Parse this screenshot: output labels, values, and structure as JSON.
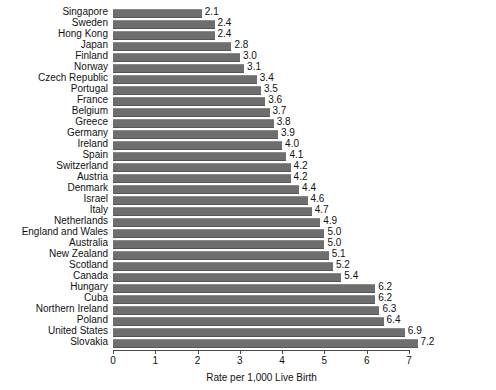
{
  "chart_data": {
    "type": "bar",
    "orientation": "horizontal",
    "title": "",
    "subtitle": "",
    "xlabel": "Rate per 1,000 Live Birth",
    "ylabel": "",
    "xlim": [
      0,
      7.4
    ],
    "xticks": [
      0,
      1,
      2,
      3,
      4,
      5,
      6,
      7
    ],
    "xtick_labels": [
      "0",
      "1",
      "2",
      "3",
      "4",
      "5",
      "6",
      "7"
    ],
    "grid": false,
    "legend": null,
    "bar_color": "#6e6e6e",
    "value_label_format": "one-decimal",
    "categories": [
      "Singapore",
      "Sweden",
      "Hong Kong",
      "Japan",
      "Finland",
      "Norway",
      "Czech Republic",
      "Portugal",
      "France",
      "Belgium",
      "Greece",
      "Germany",
      "Ireland",
      "Spain",
      "Switzerland",
      "Austria",
      "Denmark",
      "Israel",
      "Italy",
      "Netherlands",
      "England and Wales",
      "Australia",
      "New Zealand",
      "Scotland",
      "Canada",
      "Hungary",
      "Cuba",
      "Northern Ireland",
      "Poland",
      "United States",
      "Slovakia"
    ],
    "values": [
      2.1,
      2.4,
      2.4,
      2.8,
      3.0,
      3.1,
      3.4,
      3.5,
      3.6,
      3.7,
      3.8,
      3.9,
      4.0,
      4.1,
      4.2,
      4.2,
      4.4,
      4.6,
      4.7,
      4.9,
      5.0,
      5.0,
      5.1,
      5.2,
      5.4,
      6.2,
      6.2,
      6.3,
      6.4,
      6.9,
      7.2
    ],
    "value_labels": [
      "2.1",
      "2.4",
      "2.4",
      "2.8",
      "3.0",
      "3.1",
      "3.4",
      "3.5",
      "3.6",
      "3.7",
      "3.8",
      "3.9",
      "4.0",
      "4.1",
      "4.2",
      "4.2",
      "4.4",
      "4.6",
      "4.7",
      "4.9",
      "5.0",
      "5.0",
      "5.1",
      "5.2",
      "5.4",
      "6.2",
      "6.2",
      "6.3",
      "6.4",
      "6.9",
      "7.2"
    ]
  }
}
